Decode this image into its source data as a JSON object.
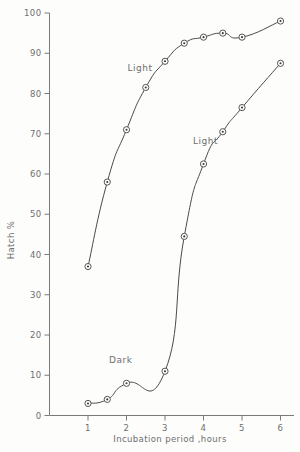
{
  "chart_data": {
    "type": "line",
    "title": "",
    "xlabel": "Incubation period ,hours",
    "ylabel": "Hatch %",
    "xlim": [
      0,
      6.35
    ],
    "ylim": [
      0,
      100
    ],
    "xticks": [
      1,
      2,
      3,
      4,
      5,
      6
    ],
    "xtick_labels": [
      "1",
      "2",
      "3",
      "4",
      "5",
      "6"
    ],
    "yticks": [
      0,
      10,
      20,
      30,
      40,
      50,
      60,
      70,
      80,
      90,
      100
    ],
    "ytick_labels": [
      "0",
      "10",
      "20",
      "30",
      "40",
      "50",
      "60",
      "70",
      "80",
      "90",
      "100"
    ],
    "grid": false,
    "legend_position": "inline-annotations",
    "marker_style": "circle-with-center-dot",
    "line_color": "#4a4a4a",
    "axis_color": "#7a7a7a",
    "annotations": [
      {
        "text": "Light",
        "x": 2.35,
        "y": 85.5
      },
      {
        "text": "Light",
        "x": 4.05,
        "y": 67.5
      },
      {
        "text": "Dark",
        "x": 1.85,
        "y": 13.0
      }
    ],
    "series": [
      {
        "name": "Light (upper curve)",
        "label": "Light",
        "points": [
          {
            "x": 1.0,
            "y": 37
          },
          {
            "x": 1.5,
            "y": 58
          },
          {
            "x": 2.0,
            "y": 71
          },
          {
            "x": 2.5,
            "y": 81.5
          },
          {
            "x": 3.0,
            "y": 88
          },
          {
            "x": 3.5,
            "y": 92.5
          },
          {
            "x": 4.0,
            "y": 94
          },
          {
            "x": 4.5,
            "y": 95
          },
          {
            "x": 5.0,
            "y": 94
          },
          {
            "x": 6.0,
            "y": 98
          }
        ]
      },
      {
        "name": "Dark then Light (lower curve)",
        "label": "Light",
        "points": [
          {
            "x": 1.0,
            "y": 3
          },
          {
            "x": 1.5,
            "y": 4
          },
          {
            "x": 2.0,
            "y": 8
          },
          {
            "x": 3.0,
            "y": 11
          },
          {
            "x": 3.5,
            "y": 44.5
          },
          {
            "x": 4.0,
            "y": 62.5
          },
          {
            "x": 4.5,
            "y": 70.5
          },
          {
            "x": 5.0,
            "y": 76.5
          },
          {
            "x": 6.0,
            "y": 87.5
          }
        ]
      }
    ]
  },
  "axes": {
    "y_title": "Hatch %",
    "x_title": "Incubation period ,hours"
  }
}
